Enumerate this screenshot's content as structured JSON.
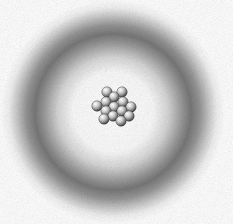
{
  "figure": {
    "components": {
      "electron_cloud": {
        "shape": "ring",
        "center": [
          113,
          112
        ],
        "peak_radius_px": 78,
        "color": "#787878"
      },
      "nucleus": {
        "particle_count": 16,
        "center": [
          113,
          106
        ],
        "particle_color": "#b0b0b0"
      }
    }
  },
  "colors": {
    "background": "#ffffff",
    "cloud_dark": "#787878",
    "sphere_light": "#f0f0f0",
    "sphere_dark": "#5a5a5a"
  }
}
